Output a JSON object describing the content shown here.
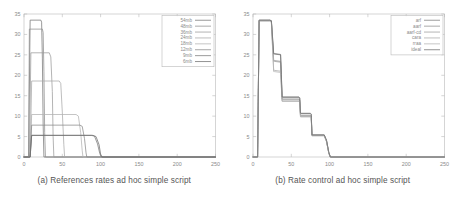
{
  "figure": {
    "panels": [
      {
        "id": "panel-a",
        "caption": "(a) References rates ad hoc simple script",
        "chart_data": {
          "type": "line",
          "title": "",
          "xlabel": "",
          "ylabel": "",
          "xlim": [
            0,
            250
          ],
          "ylim": [
            0,
            35
          ],
          "xticks": [
            0,
            50,
            100,
            150,
            200,
            250
          ],
          "yticks": [
            0,
            5,
            10,
            15,
            20,
            25,
            30,
            35
          ],
          "grid": false,
          "legend_position": "top-right",
          "series": [
            {
              "name": "54mb",
              "color": "#777777",
              "x": [
                0,
                6,
                8,
                22,
                23,
                24,
                25,
                26,
                250
              ],
              "values": [
                0,
                0,
                33.5,
                33.5,
                33.0,
                24.0,
                8.0,
                0,
                0
              ]
            },
            {
              "name": "48mb",
              "color": "#8d8d8d",
              "x": [
                0,
                6,
                7,
                24,
                25,
                26,
                27,
                28,
                250
              ],
              "values": [
                0,
                0,
                31.3,
                31.3,
                30.5,
                21.0,
                6.0,
                0,
                0
              ]
            },
            {
              "name": "36mb",
              "color": "#9b9b9b",
              "x": [
                0,
                7,
                9,
                33,
                35,
                37,
                38,
                39,
                250
              ],
              "values": [
                0,
                0,
                25.5,
                25.5,
                24.5,
                16.0,
                5.0,
                0,
                0
              ]
            },
            {
              "name": "24mb",
              "color": "#a8a8a8",
              "x": [
                0,
                8,
                10,
                46,
                48,
                50,
                52,
                53,
                250
              ],
              "values": [
                0,
                0,
                18.6,
                18.6,
                18.0,
                11.0,
                3.0,
                0,
                0
              ]
            },
            {
              "name": "18mb",
              "color": "#b2b2b2",
              "x": [
                0,
                8,
                10,
                68,
                71,
                74,
                76,
                77,
                250
              ],
              "values": [
                0,
                0,
                10.4,
                10.4,
                10.0,
                6.0,
                1.5,
                0,
                0
              ]
            },
            {
              "name": "12mb",
              "color": "#8a8a8a",
              "x": [
                0,
                8,
                10,
                73,
                76,
                79,
                81,
                82,
                250
              ],
              "values": [
                0,
                0,
                7.8,
                7.8,
                7.5,
                4.5,
                1.0,
                0,
                0
              ]
            },
            {
              "name": "9mb",
              "color": "#7a7a7a",
              "x": [
                0,
                8,
                10,
                88,
                92,
                96,
                99,
                101,
                250
              ],
              "values": [
                0,
                0,
                5.3,
                5.3,
                5.1,
                3.2,
                0.8,
                0,
                0
              ]
            },
            {
              "name": "6mb",
              "color": "#6e6e6e",
              "x": [
                0,
                8,
                10,
                90,
                94,
                98,
                100,
                102,
                250
              ],
              "values": [
                0,
                0,
                5.3,
                5.3,
                5.0,
                3.0,
                0.7,
                0,
                0
              ]
            }
          ]
        }
      },
      {
        "id": "panel-b",
        "caption": "(b) Rate control ad hoc simple script",
        "chart_data": {
          "type": "line",
          "title": "",
          "xlabel": "",
          "ylabel": "",
          "xlim": [
            0,
            250
          ],
          "ylim": [
            0,
            35
          ],
          "xticks": [
            0,
            50,
            100,
            150,
            200,
            250
          ],
          "yticks": [
            0,
            5,
            10,
            15,
            20,
            25,
            30,
            35
          ],
          "grid": false,
          "legend_position": "top-right",
          "series": [
            {
              "name": "arf",
              "color": "#7d7d7d",
              "x": [
                0,
                6,
                8,
                22,
                24,
                27,
                28,
                36,
                37,
                38,
                60,
                61,
                62,
                75,
                76,
                77,
                93,
                96,
                99,
                101,
                250
              ],
              "values": [
                0,
                0,
                33.5,
                33.5,
                33.3,
                25.2,
                25.2,
                25.0,
                20.0,
                14.6,
                14.6,
                14.4,
                10.6,
                10.6,
                10.4,
                5.4,
                5.4,
                4.0,
                1.0,
                0,
                0
              ]
            },
            {
              "name": "aarf",
              "color": "#8e8e8e",
              "x": [
                0,
                6,
                8,
                22,
                24,
                27,
                28,
                36,
                37,
                38,
                60,
                61,
                62,
                75,
                76,
                77,
                93,
                96,
                99,
                101,
                250
              ],
              "values": [
                0,
                0,
                33.4,
                33.4,
                33.2,
                23.6,
                23.6,
                23.4,
                19.0,
                14.2,
                14.2,
                14.0,
                10.2,
                10.2,
                10.0,
                5.3,
                5.3,
                3.9,
                1.0,
                0,
                0
              ]
            },
            {
              "name": "aarf-cd",
              "color": "#9c9c9c",
              "x": [
                0,
                6,
                8,
                22,
                24,
                27,
                28,
                36,
                37,
                38,
                60,
                61,
                62,
                75,
                76,
                77,
                93,
                96,
                99,
                101,
                250
              ],
              "values": [
                0,
                0,
                33.4,
                33.4,
                33.1,
                23.4,
                23.4,
                23.2,
                18.8,
                14.0,
                14.0,
                13.8,
                10.0,
                10.0,
                9.8,
                5.3,
                5.3,
                3.8,
                0.9,
                0,
                0
              ]
            },
            {
              "name": "cara",
              "color": "#a9a9a9",
              "x": [
                0,
                6,
                8,
                22,
                24,
                27,
                28,
                36,
                37,
                38,
                60,
                61,
                62,
                75,
                76,
                77,
                93,
                96,
                99,
                101,
                250
              ],
              "values": [
                0,
                0,
                33.3,
                33.3,
                33.0,
                21.2,
                21.2,
                21.0,
                17.5,
                13.7,
                13.7,
                13.5,
                9.9,
                9.9,
                9.7,
                5.2,
                5.2,
                3.8,
                0.9,
                0,
                0
              ]
            },
            {
              "name": "rraa",
              "color": "#b4b4b4",
              "x": [
                0,
                6,
                8,
                22,
                24,
                27,
                28,
                36,
                37,
                38,
                60,
                61,
                62,
                75,
                76,
                77,
                93,
                96,
                99,
                101,
                250
              ],
              "values": [
                0,
                0,
                33.3,
                33.3,
                32.9,
                20.9,
                20.9,
                20.7,
                17.2,
                13.6,
                13.6,
                13.4,
                9.8,
                9.8,
                9.6,
                5.2,
                5.2,
                3.7,
                0.9,
                0,
                0
              ]
            },
            {
              "name": "ideal",
              "color": "#6f6f6f",
              "x": [
                0,
                6,
                8,
                22,
                24,
                27,
                28,
                36,
                37,
                38,
                60,
                61,
                62,
                75,
                76,
                77,
                93,
                96,
                99,
                101,
                250
              ],
              "values": [
                0,
                0,
                33.5,
                33.5,
                33.4,
                25.3,
                25.3,
                25.1,
                20.2,
                14.7,
                14.7,
                14.5,
                10.7,
                10.7,
                10.5,
                5.4,
                5.4,
                4.1,
                1.1,
                0,
                0
              ]
            }
          ]
        }
      }
    ]
  }
}
